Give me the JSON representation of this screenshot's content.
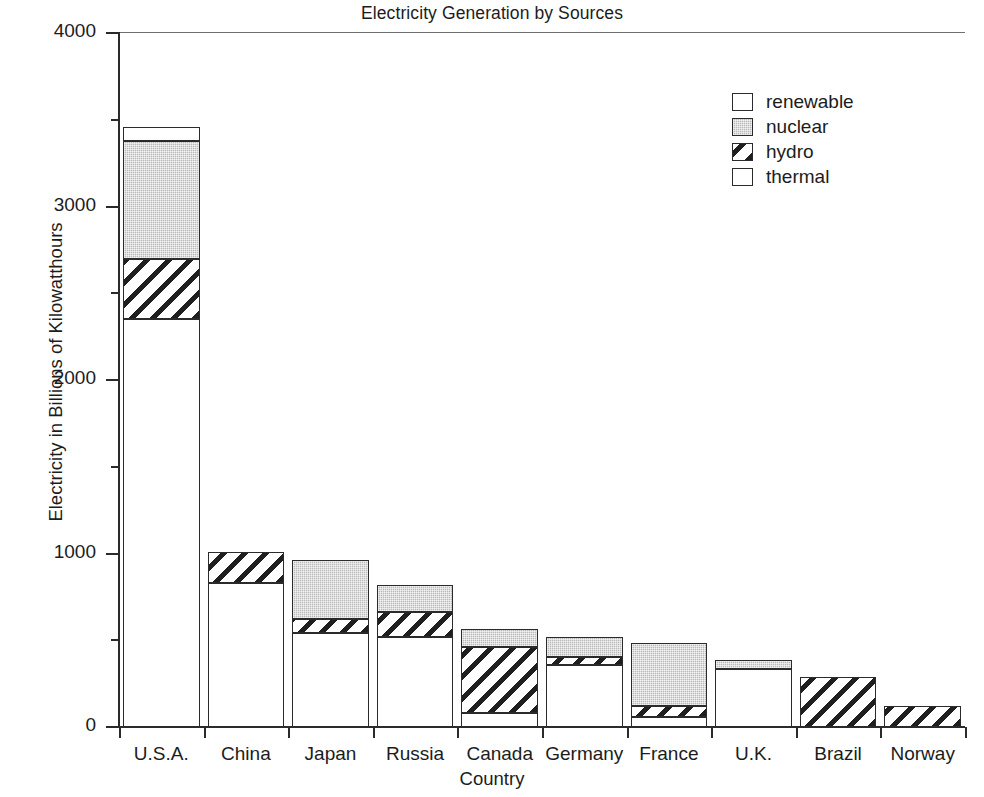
{
  "chart_data": {
    "type": "bar",
    "subtype": "stacked-vertical",
    "title": "Electricity Generation by Sources",
    "xlabel": "Country",
    "ylabel": "Electricity in Billions of Kilowatthours",
    "categories": [
      "U.S.A.",
      "China",
      "Japan",
      "Russia",
      "Canada",
      "Germany",
      "France",
      "U.K.",
      "Brazil",
      "Norway"
    ],
    "series": [
      {
        "name": "thermal",
        "values": [
          2350,
          830,
          540,
          520,
          80,
          360,
          55,
          335,
          0,
          0
        ]
      },
      {
        "name": "hydro",
        "values": [
          350,
          180,
          80,
          145,
          380,
          45,
          65,
          0,
          290,
          120
        ]
      },
      {
        "name": "nuclear",
        "values": [
          680,
          0,
          340,
          155,
          105,
          115,
          365,
          50,
          0,
          0
        ]
      },
      {
        "name": "renewable",
        "values": [
          80,
          0,
          0,
          0,
          0,
          0,
          0,
          0,
          0,
          0
        ]
      }
    ],
    "totals": [
      3460,
      1010,
      960,
      820,
      565,
      520,
      485,
      385,
      290,
      120
    ],
    "ylim": [
      0,
      4000
    ],
    "y_major_ticks": [
      0,
      1000,
      2000,
      3000,
      4000
    ],
    "y_minor_ticks": [
      500,
      1500,
      2500,
      3500
    ],
    "y_tick_labels": [
      "0",
      "1000",
      "2000",
      "3000",
      "4000"
    ],
    "grid": false,
    "legend_position": "top-right",
    "legend_order": [
      "renewable",
      "nuclear",
      "hydro",
      "thermal"
    ],
    "colors": {
      "thermal": "#ffffff",
      "hydro": "#ffffff",
      "nuclear": "#b9b9b9",
      "renewable": "#ffffff",
      "axis": "#2b2b2b",
      "text": "#1c1c1c"
    },
    "patterns": {
      "thermal": "solid-white",
      "hydro": "diagonal-hatch",
      "nuclear": "stipple-gray",
      "renewable": "solid-white"
    }
  },
  "legend": {
    "items": [
      {
        "label": "renewable",
        "pattern": "renewable"
      },
      {
        "label": "nuclear",
        "pattern": "nuclear"
      },
      {
        "label": "hydro",
        "pattern": "hydro"
      },
      {
        "label": "thermal",
        "pattern": "thermal"
      }
    ]
  }
}
